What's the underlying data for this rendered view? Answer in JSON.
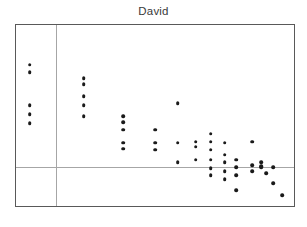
{
  "chart_data": {
    "type": "scatter",
    "title": "David",
    "xlabel": "",
    "ylabel": "",
    "xlim": [
      0,
      280
    ],
    "ylim": [
      0,
      183
    ],
    "grid": true,
    "gridlines": {
      "vertical": [
        40
      ],
      "horizontal": [
        144
      ]
    },
    "legend": null,
    "annotations": [],
    "points": [
      {
        "x": 14,
        "y": 40
      },
      {
        "x": 14,
        "y": 48
      },
      {
        "x": 14,
        "y": 81
      },
      {
        "x": 14,
        "y": 90
      },
      {
        "x": 14,
        "y": 99
      },
      {
        "x": 68,
        "y": 54
      },
      {
        "x": 68,
        "y": 60
      },
      {
        "x": 68,
        "y": 72
      },
      {
        "x": 68,
        "y": 81
      },
      {
        "x": 68,
        "y": 92
      },
      {
        "x": 108,
        "y": 92
      },
      {
        "x": 108,
        "y": 98
      },
      {
        "x": 108,
        "y": 106
      },
      {
        "x": 108,
        "y": 119
      },
      {
        "x": 108,
        "y": 125
      },
      {
        "x": 140,
        "y": 106
      },
      {
        "x": 140,
        "y": 119
      },
      {
        "x": 140,
        "y": 126
      },
      {
        "x": 163,
        "y": 79
      },
      {
        "x": 163,
        "y": 119
      },
      {
        "x": 163,
        "y": 139
      },
      {
        "x": 181,
        "y": 118
      },
      {
        "x": 181,
        "y": 123
      },
      {
        "x": 181,
        "y": 136
      },
      {
        "x": 196,
        "y": 110
      },
      {
        "x": 196,
        "y": 118
      },
      {
        "x": 196,
        "y": 126
      },
      {
        "x": 196,
        "y": 136
      },
      {
        "x": 196,
        "y": 145
      },
      {
        "x": 196,
        "y": 152
      },
      {
        "x": 210,
        "y": 119
      },
      {
        "x": 210,
        "y": 131
      },
      {
        "x": 210,
        "y": 139
      },
      {
        "x": 210,
        "y": 148
      },
      {
        "x": 210,
        "y": 156
      },
      {
        "x": 222,
        "y": 136
      },
      {
        "x": 222,
        "y": 144
      },
      {
        "x": 222,
        "y": 152
      },
      {
        "x": 222,
        "y": 167
      },
      {
        "x": 238,
        "y": 118
      },
      {
        "x": 238,
        "y": 142
      },
      {
        "x": 238,
        "y": 148
      },
      {
        "x": 247,
        "y": 139
      },
      {
        "x": 247,
        "y": 143
      },
      {
        "x": 247,
        "y": 144
      },
      {
        "x": 252,
        "y": 150
      },
      {
        "x": 259,
        "y": 144
      },
      {
        "x": 259,
        "y": 160
      },
      {
        "x": 268,
        "y": 172
      }
    ]
  }
}
